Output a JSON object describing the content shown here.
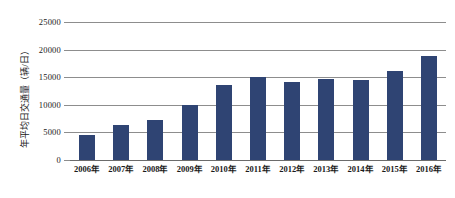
{
  "chart_data": {
    "type": "bar",
    "title": "",
    "subtitle": "",
    "xlabel": "",
    "ylabel": "年平均日交通量（辆/日）",
    "categories": [
      "2006年",
      "2007年",
      "2008年",
      "2009年",
      "2010年",
      "2011年",
      "2012年",
      "2013年",
      "2014年",
      "2015年",
      "2016年"
    ],
    "values": [
      4600,
      6400,
      7200,
      10000,
      13500,
      15100,
      14200,
      14700,
      14500,
      16100,
      18900
    ],
    "series": [
      {
        "name": "年平均日交通量",
        "values": [
          4600,
          6400,
          7200,
          10000,
          13500,
          15100,
          14200,
          14700,
          14500,
          16100,
          18900
        ]
      }
    ],
    "ylim": [
      0,
      25000
    ],
    "yticks": [
      0,
      5000,
      10000,
      15000,
      20000,
      25000
    ],
    "ytick_labels": [
      "0",
      "5000",
      "10000",
      "15000",
      "20000",
      "25000"
    ],
    "grid": true,
    "legend": false,
    "legend_position": "none",
    "bar_color": "#2f4473",
    "gridline_color": "#8d8d8d",
    "background_color": "#ffffff"
  }
}
